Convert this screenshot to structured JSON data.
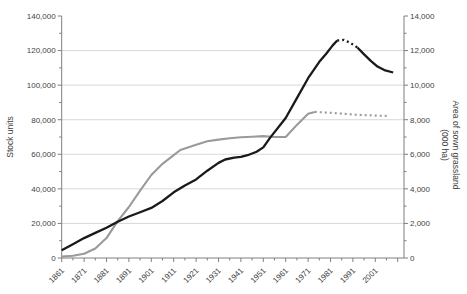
{
  "chart_data": {
    "type": "line",
    "title": "",
    "left_axis": {
      "label": "Stock units",
      "min": 0,
      "max": 140000,
      "major_step": 20000,
      "minor_step": 10000,
      "tick_labels": [
        "0",
        "20,000",
        "40,000",
        "60,000",
        "80,000",
        "100,000",
        "120,000",
        "140,000"
      ]
    },
    "right_axis": {
      "label_line1": "Area of sown grassland",
      "label_line2": "(000 ha)",
      "min": 0,
      "max": 14000,
      "major_step": 2000,
      "minor_step": 1000,
      "tick_labels": [
        "0",
        "2,000",
        "4,000",
        "6,000",
        "8,000",
        "10,000",
        "12,000",
        "14,000"
      ]
    },
    "x_axis": {
      "first_year": 1861,
      "last_labeled_year": 2001,
      "axis_end_year": 2013,
      "major_step": 10,
      "minor_step": 5,
      "tick_labels": [
        "1861",
        "1871",
        "1881",
        "1891",
        "1901",
        "1911",
        "1921",
        "1931",
        "1941",
        "1951",
        "1961",
        "1971",
        "1981",
        "1991",
        "2001"
      ]
    },
    "grid": {
      "color": "#d9d9d9",
      "left_values": [
        20000,
        40000,
        60000,
        80000,
        100000,
        120000
      ]
    },
    "axis_color": "#7f7f7f",
    "text_color": "#3f3f3f",
    "series": [
      {
        "name": "Area of sown grassland (000 ha)",
        "axis": "right",
        "color": "#9a9a9a",
        "width": 2.1,
        "segments": [
          {
            "style": "solid",
            "points": [
              [
                1861,
                80
              ],
              [
                1866,
                130
              ],
              [
                1871,
                250
              ],
              [
                1876,
                550
              ],
              [
                1881,
                1150
              ],
              [
                1886,
                2130
              ],
              [
                1891,
                2950
              ],
              [
                1896,
                3900
              ],
              [
                1901,
                4800
              ],
              [
                1906,
                5450
              ],
              [
                1911,
                5950
              ],
              [
                1914,
                6250
              ],
              [
                1921,
                6550
              ],
              [
                1926,
                6750
              ],
              [
                1931,
                6850
              ],
              [
                1936,
                6930
              ],
              [
                1941,
                6980
              ],
              [
                1946,
                7020
              ],
              [
                1951,
                7050
              ],
              [
                1956,
                7000
              ],
              [
                1961,
                7000
              ],
              [
                1966,
                7700
              ],
              [
                1971,
                8350
              ],
              [
                1974,
                8450
              ]
            ]
          },
          {
            "style": "dashed",
            "points": [
              [
                1974,
                8450
              ],
              [
                1981,
                8400
              ],
              [
                1991,
                8300
              ],
              [
                2001,
                8240
              ],
              [
                2007,
                8220
              ]
            ]
          }
        ]
      },
      {
        "name": "Stock units",
        "axis": "left",
        "color": "#1a1a1a",
        "width": 2.3,
        "segments": [
          {
            "style": "solid",
            "points": [
              [
                1861,
                4500
              ],
              [
                1866,
                8000
              ],
              [
                1871,
                11500
              ],
              [
                1876,
                14500
              ],
              [
                1881,
                17500
              ],
              [
                1886,
                21000
              ],
              [
                1891,
                24000
              ],
              [
                1896,
                26500
              ],
              [
                1901,
                29000
              ],
              [
                1906,
                33000
              ],
              [
                1911,
                38000
              ],
              [
                1916,
                42000
              ],
              [
                1921,
                45500
              ],
              [
                1926,
                50500
              ],
              [
                1931,
                55000
              ],
              [
                1934,
                57000
              ],
              [
                1938,
                58000
              ],
              [
                1941,
                58500
              ],
              [
                1944,
                59500
              ],
              [
                1948,
                61500
              ],
              [
                1951,
                64000
              ],
              [
                1954,
                69500
              ],
              [
                1961,
                81000
              ],
              [
                1966,
                92500
              ],
              [
                1971,
                104000
              ],
              [
                1976,
                113500
              ],
              [
                1979,
                118000
              ],
              [
                1982,
                123000
              ],
              [
                1984,
                125800
              ]
            ]
          },
          {
            "style": "dashed",
            "points": [
              [
                1984,
                125800
              ],
              [
                1987,
                126200
              ],
              [
                1990,
                124300
              ],
              [
                1993,
                121800
              ]
            ]
          },
          {
            "style": "solid",
            "points": [
              [
                1993,
                121800
              ],
              [
                1996,
                117800
              ],
              [
                1999,
                114000
              ],
              [
                2002,
                110700
              ],
              [
                2005,
                108700
              ],
              [
                2009,
                107300
              ]
            ]
          }
        ]
      }
    ]
  }
}
